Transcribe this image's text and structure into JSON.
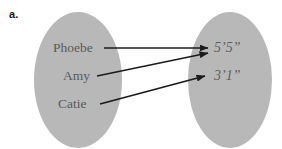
{
  "figure": {
    "part_label": "a.",
    "background_color": "#ffffff",
    "ellipse_fill": "#b8b8b8",
    "text_color": "#5a5a5a",
    "arrow_color": "#1c1c1c",
    "domain_set": {
      "name": "people",
      "items": [
        {
          "id": "phoebe",
          "label": "Phoebe"
        },
        {
          "id": "amy",
          "label": "Amy"
        },
        {
          "id": "catie",
          "label": "Catie"
        }
      ]
    },
    "range_set": {
      "name": "heights",
      "items": [
        {
          "id": "h55",
          "label": "5’5”"
        },
        {
          "id": "h31",
          "label": "3’1”"
        }
      ]
    },
    "mappings": [
      {
        "from": "phoebe",
        "to": "h55"
      },
      {
        "from": "amy",
        "to": "h55"
      },
      {
        "from": "catie",
        "to": "h31"
      }
    ]
  }
}
